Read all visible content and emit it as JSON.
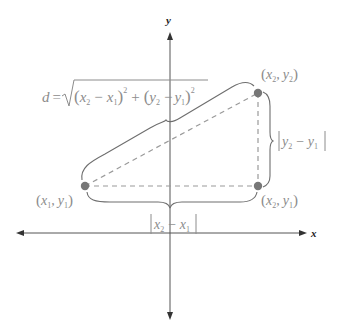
{
  "diagram": {
    "axes": {
      "x_label": "x",
      "y_label": "y",
      "origin": [
        170,
        233
      ]
    },
    "points": [
      {
        "id": "p1",
        "label": "(x₁, y₁)",
        "var_x": "x",
        "sub_x": "1",
        "var_y": "y",
        "sub_y": "1",
        "pos": [
          85,
          186
        ]
      },
      {
        "id": "p2",
        "label": "(x₂, y₂)",
        "var_x": "x",
        "sub_x": "2",
        "var_y": "y",
        "sub_y": "2",
        "pos": [
          258,
          93
        ]
      },
      {
        "id": "p3",
        "label": "(x₂, y₁)",
        "var_x": "x",
        "sub_x": "2",
        "var_y": "y",
        "sub_y": "1",
        "pos": [
          258,
          186
        ]
      }
    ],
    "formula": {
      "text": "d = √((x₂ − x₁)² + (y₂ − y₁)²)",
      "lhs": "d",
      "eq": "=",
      "radical": "√",
      "open": "(",
      "close": ")",
      "x": "x",
      "y": "y",
      "minus": "−",
      "plus": "+",
      "sub1": "1",
      "sub2": "2",
      "sup": "2"
    },
    "horizontal_label": {
      "text": "|x₂ − x₁|",
      "var": "x",
      "minus": "−",
      "sub_a": "2",
      "sub_b": "1"
    },
    "vertical_label": {
      "text": "|y₂ − y₁|",
      "var": "y",
      "minus": "−",
      "sub_a": "2",
      "sub_b": "1"
    },
    "punct": {
      "comma": ",",
      "open": "(",
      "close": ")",
      "bar": "|"
    },
    "colors": {
      "axis": "#555555",
      "brace": "#6e6e6e",
      "dashed": "#9a9a9a",
      "point": "#777777",
      "text": "#8c8c8c"
    }
  }
}
